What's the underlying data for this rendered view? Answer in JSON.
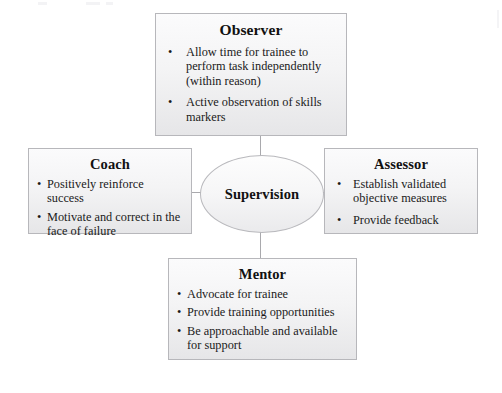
{
  "diagram": {
    "center": {
      "label": "Supervision",
      "shape": "ellipse"
    },
    "accent_color": "#b7b7bb",
    "box_fill": "#f2f2f3",
    "nodes": [
      {
        "id": "observer",
        "title": "Observer",
        "position": "top",
        "bullet_glyph": "•",
        "bullets": [
          "Allow time for trainee to perform task independently (within reason)",
          "Active observation of skills markers"
        ]
      },
      {
        "id": "coach",
        "title": "Coach",
        "position": "left",
        "bullet_glyph": "•",
        "bullets": [
          "Positively reinforce success",
          "Motivate and correct in the face of failure"
        ]
      },
      {
        "id": "assessor",
        "title": "Assessor",
        "position": "right",
        "bullet_glyph": "•",
        "bullets": [
          "Establish validated objective measures",
          "Provide feedback"
        ]
      },
      {
        "id": "mentor",
        "title": "Mentor",
        "position": "bottom",
        "bullet_glyph": "•",
        "bullets": [
          "Advocate for trainee",
          "Provide training opportunities",
          "Be approachable and available for support"
        ]
      }
    ]
  }
}
